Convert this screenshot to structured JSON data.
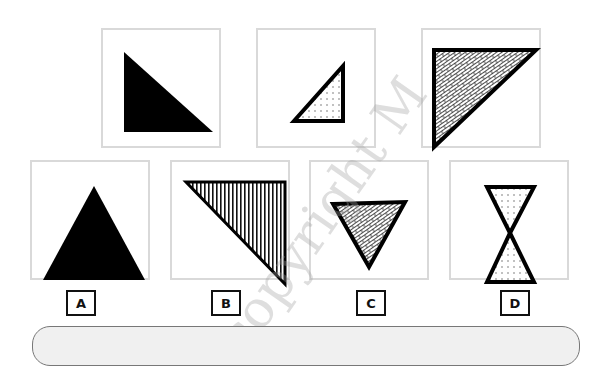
{
  "problem_figures": [
    {
      "id": "p1",
      "description": "solid black right triangle, right angle bottom-left"
    },
    {
      "id": "p2",
      "description": "small dotted right triangle with thick outline, right angle bottom-right"
    },
    {
      "id": "p3",
      "description": "brick-hatched right triangle with thick outline, right angle top-left"
    }
  ],
  "answer_figures": [
    {
      "id": "A",
      "label": "A",
      "description": "solid black equilateral triangle pointing up"
    },
    {
      "id": "B",
      "label": "B",
      "description": "vertical-striped right triangle, right angle top-right"
    },
    {
      "id": "C",
      "label": "C",
      "description": "brick-hatched inverted triangle with thick outline"
    },
    {
      "id": "D",
      "label": "D",
      "description": "dotted hourglass of two triangles with thick outline"
    }
  ],
  "watermark": "copyright M",
  "colors": {
    "frame": "#d9d9d9",
    "ink": "#111111",
    "panel": "#f0f0f0"
  }
}
